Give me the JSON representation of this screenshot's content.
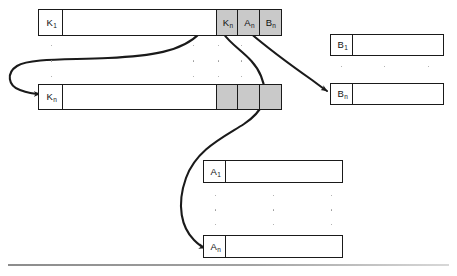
{
  "figure": {
    "background_color": "#ffffff",
    "line_color": "#1a1a1a",
    "shaded_cell_color": "#c9c9c9",
    "rule_color": "#8c8c8c"
  },
  "records": {
    "k_first": {
      "name": "K1 record row",
      "label": "K",
      "subscript": "1",
      "cells": [
        {
          "label": "K",
          "subscript": "1",
          "shaded": false,
          "width": 26
        },
        {
          "label": "",
          "subscript": "",
          "shaded": false,
          "width": 155
        },
        {
          "label": "K",
          "subscript": "n",
          "shaded": true,
          "width": 23
        },
        {
          "label": "A",
          "subscript": "n",
          "shaded": true,
          "width": 23
        },
        {
          "label": "B",
          "subscript": "n",
          "shaded": true,
          "width": 23
        }
      ]
    },
    "k_last": {
      "name": "Kn record row",
      "label": "K",
      "subscript": "n",
      "cells": [
        {
          "label": "K",
          "subscript": "n",
          "shaded": false,
          "width": 26
        },
        {
          "label": "",
          "subscript": "",
          "shaded": false,
          "width": 155
        },
        {
          "label": "",
          "subscript": "",
          "shaded": true,
          "width": 23
        },
        {
          "label": "",
          "subscript": "",
          "shaded": true,
          "width": 23
        },
        {
          "label": "",
          "subscript": "",
          "shaded": true,
          "width": 23
        }
      ]
    },
    "b_first": {
      "name": "B1 record row",
      "label": "B",
      "subscript": "1",
      "cells": [
        {
          "label": "B",
          "subscript": "1",
          "shaded": false,
          "width": 24
        },
        {
          "label": "",
          "subscript": "",
          "shaded": false,
          "width": 92
        }
      ]
    },
    "b_last": {
      "name": "Bn record row",
      "label": "B",
      "subscript": "n",
      "cells": [
        {
          "label": "B",
          "subscript": "n",
          "shaded": false,
          "width": 24
        },
        {
          "label": "",
          "subscript": "",
          "shaded": false,
          "width": 92
        }
      ]
    },
    "a_first": {
      "name": "A1 record row",
      "label": "A",
      "subscript": "1",
      "cells": [
        {
          "label": "A",
          "subscript": "1",
          "shaded": false,
          "width": 24
        },
        {
          "label": "",
          "subscript": "",
          "shaded": false,
          "width": 118
        }
      ]
    },
    "a_last": {
      "name": "An record row",
      "label": "A",
      "subscript": "n",
      "cells": [
        {
          "label": "A",
          "subscript": "n",
          "shaded": false,
          "width": 24
        },
        {
          "label": "",
          "subscript": "",
          "shaded": false,
          "width": 118
        }
      ]
    }
  },
  "ellipses": {
    "k_group": {
      "name": "vertical ellipsis between K rows",
      "dot_count": 3,
      "columns": 3
    },
    "a_group": {
      "name": "vertical ellipsis between A rows",
      "dot_count": 3,
      "columns": 3
    },
    "b_group": {
      "name": "vertical ellipsis between B rows",
      "dot_count": 1,
      "columns": 3
    }
  },
  "arrows": [
    {
      "name": "arrow-kn-to-k-last",
      "from": "K1 row Kn pointer cell",
      "to": "Kn record row"
    },
    {
      "name": "arrow-an-to-a-last",
      "from": "K1 row An pointer cell",
      "to": "An record row"
    },
    {
      "name": "arrow-bn-to-b-last",
      "from": "K1 row Bn pointer cell",
      "to": "Bn record row"
    }
  ]
}
